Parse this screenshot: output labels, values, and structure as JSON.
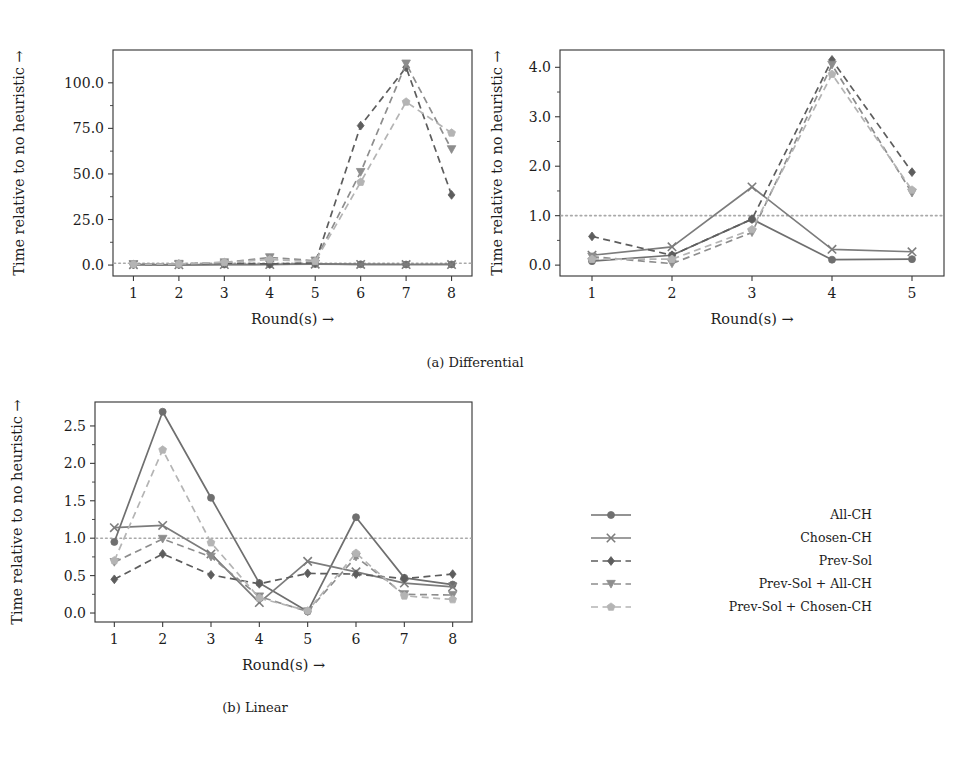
{
  "figure": {
    "subfigures": [
      {
        "key": "a",
        "caption": "(a) Differential"
      },
      {
        "key": "b",
        "caption": "(b) Linear"
      }
    ]
  },
  "legend": {
    "position": "center-right",
    "entries": [
      {
        "label": "All-CH",
        "marker": "circle",
        "linestyle": "solid",
        "color": "#6f6f6f"
      },
      {
        "label": "Chosen-CH",
        "marker": "x",
        "linestyle": "solid",
        "color": "#7c7c7c"
      },
      {
        "label": "Prev-Sol",
        "marker": "diamond",
        "linestyle": "dashed",
        "color": "#5d5d5d"
      },
      {
        "label": "Prev-Sol + All-CH",
        "marker": "triangle-down",
        "linestyle": "dashed",
        "color": "#8d8d8d"
      },
      {
        "label": "Prev-Sol + Chosen-CH",
        "marker": "pentagon",
        "linestyle": "dashed",
        "color": "#b4b4b4"
      }
    ]
  },
  "chart_data": [
    {
      "id": "differential-left",
      "type": "line",
      "title": "",
      "xlabel": "Round(s) →",
      "ylabel": "Time relative to no heuristic →",
      "x": [
        1,
        2,
        3,
        4,
        5,
        6,
        7,
        8
      ],
      "xticklabels": [
        "1",
        "2",
        "3",
        "4",
        "5",
        "6",
        "7",
        "8"
      ],
      "yticks": [
        0.0,
        25.0,
        50.0,
        75.0,
        100.0
      ],
      "yticklabels": [
        "0.0",
        "25.0",
        "50.0",
        "75.0",
        "100.0"
      ],
      "ylim": [
        -6,
        118
      ],
      "xlim": [
        0.55,
        8.45
      ],
      "grid": false,
      "reference_line": {
        "y": 1.0,
        "style": "dotted",
        "color": "#a9a9a9"
      },
      "series": [
        {
          "name": "All-CH",
          "values": [
            0.2,
            0.15,
            0.3,
            0.3,
            0.6,
            0.4,
            0.3,
            0.35
          ]
        },
        {
          "name": "Chosen-CH",
          "values": [
            0.2,
            0.15,
            0.25,
            0.3,
            0.5,
            0.35,
            0.3,
            0.3
          ]
        },
        {
          "name": "Prev-Sol",
          "values": [
            0.3,
            0.5,
            1.1,
            0.6,
            1.2,
            76.5,
            108.5,
            38.5
          ]
        },
        {
          "name": "Prev-Sol + All-CH",
          "values": [
            0.4,
            0.6,
            1.4,
            4.2,
            2.4,
            51.0,
            110.5,
            63.5
          ]
        },
        {
          "name": "Prev-Sol + Chosen-CH",
          "values": [
            0.4,
            0.6,
            1.5,
            3.0,
            2.0,
            45.5,
            89.5,
            72.5
          ]
        }
      ]
    },
    {
      "id": "differential-right",
      "type": "line",
      "title": "",
      "xlabel": "Round(s) →",
      "ylabel": "Time relative to no heuristic →",
      "x": [
        1,
        2,
        3,
        4,
        5
      ],
      "xticklabels": [
        "1",
        "2",
        "3",
        "4",
        "5"
      ],
      "yticks": [
        0.0,
        1.0,
        2.0,
        3.0,
        4.0
      ],
      "yticklabels": [
        "0.0",
        "1.0",
        "2.0",
        "3.0",
        "4.0"
      ],
      "ylim": [
        -0.22,
        4.35
      ],
      "xlim": [
        0.6,
        5.4
      ],
      "grid": false,
      "reference_line": {
        "y": 1.0,
        "style": "dotted",
        "color": "#a9a9a9"
      },
      "series": [
        {
          "name": "All-CH",
          "values": [
            0.08,
            0.2,
            0.93,
            0.11,
            0.12
          ]
        },
        {
          "name": "Chosen-CH",
          "values": [
            0.2,
            0.37,
            1.58,
            0.32,
            0.27
          ]
        },
        {
          "name": "Prev-Sol",
          "values": [
            0.58,
            0.2,
            0.93,
            4.15,
            1.88
          ]
        },
        {
          "name": "Prev-Sol + All-CH",
          "values": [
            0.17,
            0.03,
            0.66,
            4.05,
            1.46
          ]
        },
        {
          "name": "Prev-Sol + Chosen-CH",
          "values": [
            0.12,
            0.12,
            0.72,
            3.86,
            1.52
          ]
        }
      ]
    },
    {
      "id": "linear",
      "type": "line",
      "title": "",
      "xlabel": "Round(s) →",
      "ylabel": "Time relative to no heuristic →",
      "x": [
        1,
        2,
        3,
        4,
        5,
        6,
        7,
        8
      ],
      "xticklabels": [
        "1",
        "2",
        "3",
        "4",
        "5",
        "6",
        "7",
        "8"
      ],
      "yticks": [
        0.0,
        0.5,
        1.0,
        1.5,
        2.0,
        2.5
      ],
      "yticklabels": [
        "0.0",
        "0.5",
        "1.0",
        "1.5",
        "2.0",
        "2.5"
      ],
      "ylim": [
        -0.12,
        2.82
      ],
      "xlim": [
        0.6,
        8.4
      ],
      "grid": false,
      "reference_line": {
        "y": 1.0,
        "style": "dotted",
        "color": "#a9a9a9"
      },
      "series": [
        {
          "name": "All-CH",
          "values": [
            0.95,
            2.69,
            1.54,
            0.4,
            0.02,
            1.28,
            0.47,
            0.38
          ]
        },
        {
          "name": "Chosen-CH",
          "values": [
            1.14,
            1.17,
            0.79,
            0.14,
            0.69,
            0.55,
            0.4,
            0.35
          ]
        },
        {
          "name": "Prev-Sol",
          "values": [
            0.45,
            0.79,
            0.51,
            0.39,
            0.53,
            0.52,
            0.46,
            0.52
          ]
        },
        {
          "name": "Prev-Sol + All-CH",
          "values": [
            0.68,
            0.99,
            0.75,
            0.22,
            0.02,
            0.75,
            0.25,
            0.24
          ]
        },
        {
          "name": "Prev-Sol + Chosen-CH",
          "values": [
            0.7,
            2.18,
            0.94,
            0.2,
            0.03,
            0.8,
            0.23,
            0.18
          ]
        }
      ]
    }
  ]
}
